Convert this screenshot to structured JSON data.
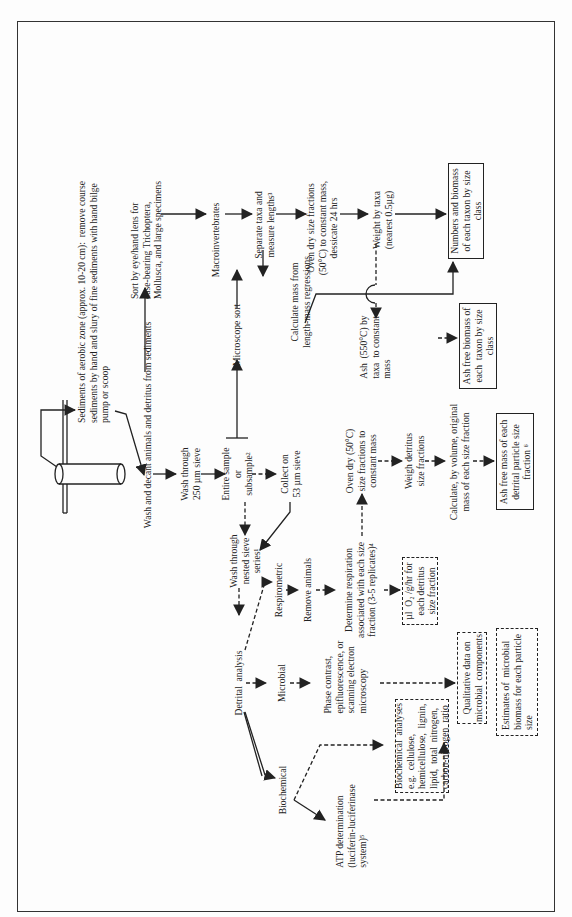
{
  "diagram": {
    "orientation": "rotated-90-ccw",
    "nodes": {
      "sediments": "Sediments of aerobic zone (approx. 10-20 cm):  remove course\nsediments by hand and slury of fine sediments with hand bilge\npump or scoop",
      "wash_decant": "Wash and decant animals and detritus from sediments",
      "sort_eye": "Sort by eye/hand lens for\ncase-bearing Trichoptera,\nMollusca, and large specimens",
      "wash_250": "Wash through\n250 µm sieve",
      "entire_sample": "Entire sample\nor\nsubsample²",
      "microscope_sort": "Microscope sort",
      "macroinvertebrates": "Macroinvertebrates",
      "separate_taxa": "Separate taxa and\nmeasure lengths³",
      "oven_dry_taxa": "Oven dry size fractions\n(50°C) to constant mass,\ndessicate 24 hrs",
      "weight_by_taxa": "Weight by taxa\n(nearest 0.5µg)",
      "numbers_biomass": "Numbers and biomass\nof each taxon by size\nclass",
      "calculate_mass": "Calculate mass from\nlength-mass regressions",
      "ash_550": "Ash  (550°C) by\ntaxa  to constant\nmass",
      "ash_free_biomass": "Ash free biomass of\neach  taxon by size\nclass",
      "collect_53": "Collect on\n53 µm sieve",
      "wash_nested": "Wash through\nnested sieve\nseries¹",
      "oven_dry_fractions": "Oven dry (50°C)\nsize fractions to\nconstant mass",
      "weigh_detritus": "Weigh detritus\nsize fractions",
      "calculate_volume": "Calculate, by volume, original\nmass of each size fraction",
      "ash_free_mass": "Ash free mass of each\ndetrital particle size\nfraction ⁶",
      "detrital_analysis": "Detrital  analysis",
      "respirometric": "Respirometric",
      "remove_animals": "Remove animals",
      "determine_respiration": "Determine respiration\nassociated with each size\nfraction (3-5 replicates)⁴",
      "ul_o2": "µl  O₂ /g/hr for\neach detritus\nsize fraction",
      "microbial": "Microbial",
      "phase_contrast": "Phase contrast,\nepifluorescence, or\nscanning electron\nmicroscopy",
      "qualitative_data": "Qualitative data on\nmicrobial  components",
      "biochemical": "Biochemical",
      "biochemical_analyses": "Biochemical  analyses\ne.g.  cellulose,\nhemicellulose,  lignin,\nlipid,  total  nitrogen,\ncarbon-nitrogen  ratio",
      "atp_determination": "ATP determination\n(luciferin-luciferinase\nsystem)⁵",
      "estimates_microbial": "Estimates of  microbial\nbiomass for each particle\nsize"
    },
    "colors": {
      "line": "#222222",
      "background": "#fdfdfd",
      "frame": "#333333"
    }
  }
}
